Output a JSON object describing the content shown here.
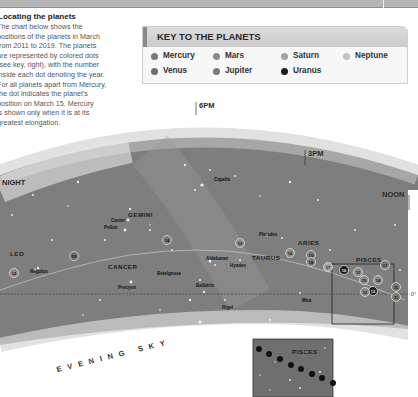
{
  "header": {
    "bar_text_right": ""
  },
  "intro": {
    "title": "Locating the planets",
    "lines": [
      "The chart below shows the",
      "positions of the planets in March",
      "from 2011 to 2019. The planets",
      "are represented by colored dots",
      "(see key, right), with the number",
      "inside each dot denoting the year.",
      "For all planets apart from Mercury,",
      "the dot indicates the planet's",
      "position on March 15. Mercury",
      "is shown only when it is at its",
      "greatest elongation."
    ]
  },
  "key": {
    "title": "KEY TO THE PLANETS",
    "items": [
      {
        "label": "Mercury",
        "color": "#7a7a7a"
      },
      {
        "label": "Venus",
        "color": "#6e6e6e"
      },
      {
        "label": "Mars",
        "color": "#8a8a8a"
      },
      {
        "label": "Jupiter",
        "color": "#7b7b7b"
      },
      {
        "label": "Saturn",
        "color": "#a3a3a3"
      },
      {
        "label": "Uranus",
        "color": "#1e1e1e"
      },
      {
        "label": "Neptune",
        "color": "#c4c4c4"
      }
    ]
  },
  "sky": {
    "times": {
      "six_pm": "6PM",
      "three_pm": "3PM",
      "noon": "NOON",
      "night": "NIGHT"
    },
    "constellations": {
      "gemini": "GEMINI",
      "leo": "LEO",
      "cancer": "CANCER",
      "taurus": "TAURUS",
      "aries": "ARIES",
      "pisces": "PISCES"
    },
    "stars": {
      "capella": "Capella",
      "castor": "Castor",
      "pollux": "Pollux",
      "regulus": "Regulus",
      "procyon": "Procyon",
      "betelgeuse": "Betelgeuse",
      "bellatrix": "Bellatrix",
      "aldebaran": "Aldebaran",
      "hyades": "Hyades",
      "pleiades": "Pleiades",
      "rigel": "Rigel",
      "mira": "Mira"
    },
    "equator_label": "0°",
    "caption": "EVENING SKY",
    "inset_title": "PISCES",
    "planet_markers": [
      "12",
      "15",
      "14",
      "13",
      "16",
      "19",
      "18",
      "17",
      "16",
      "11",
      "17",
      "15",
      "14",
      "13",
      "12",
      "11"
    ]
  }
}
